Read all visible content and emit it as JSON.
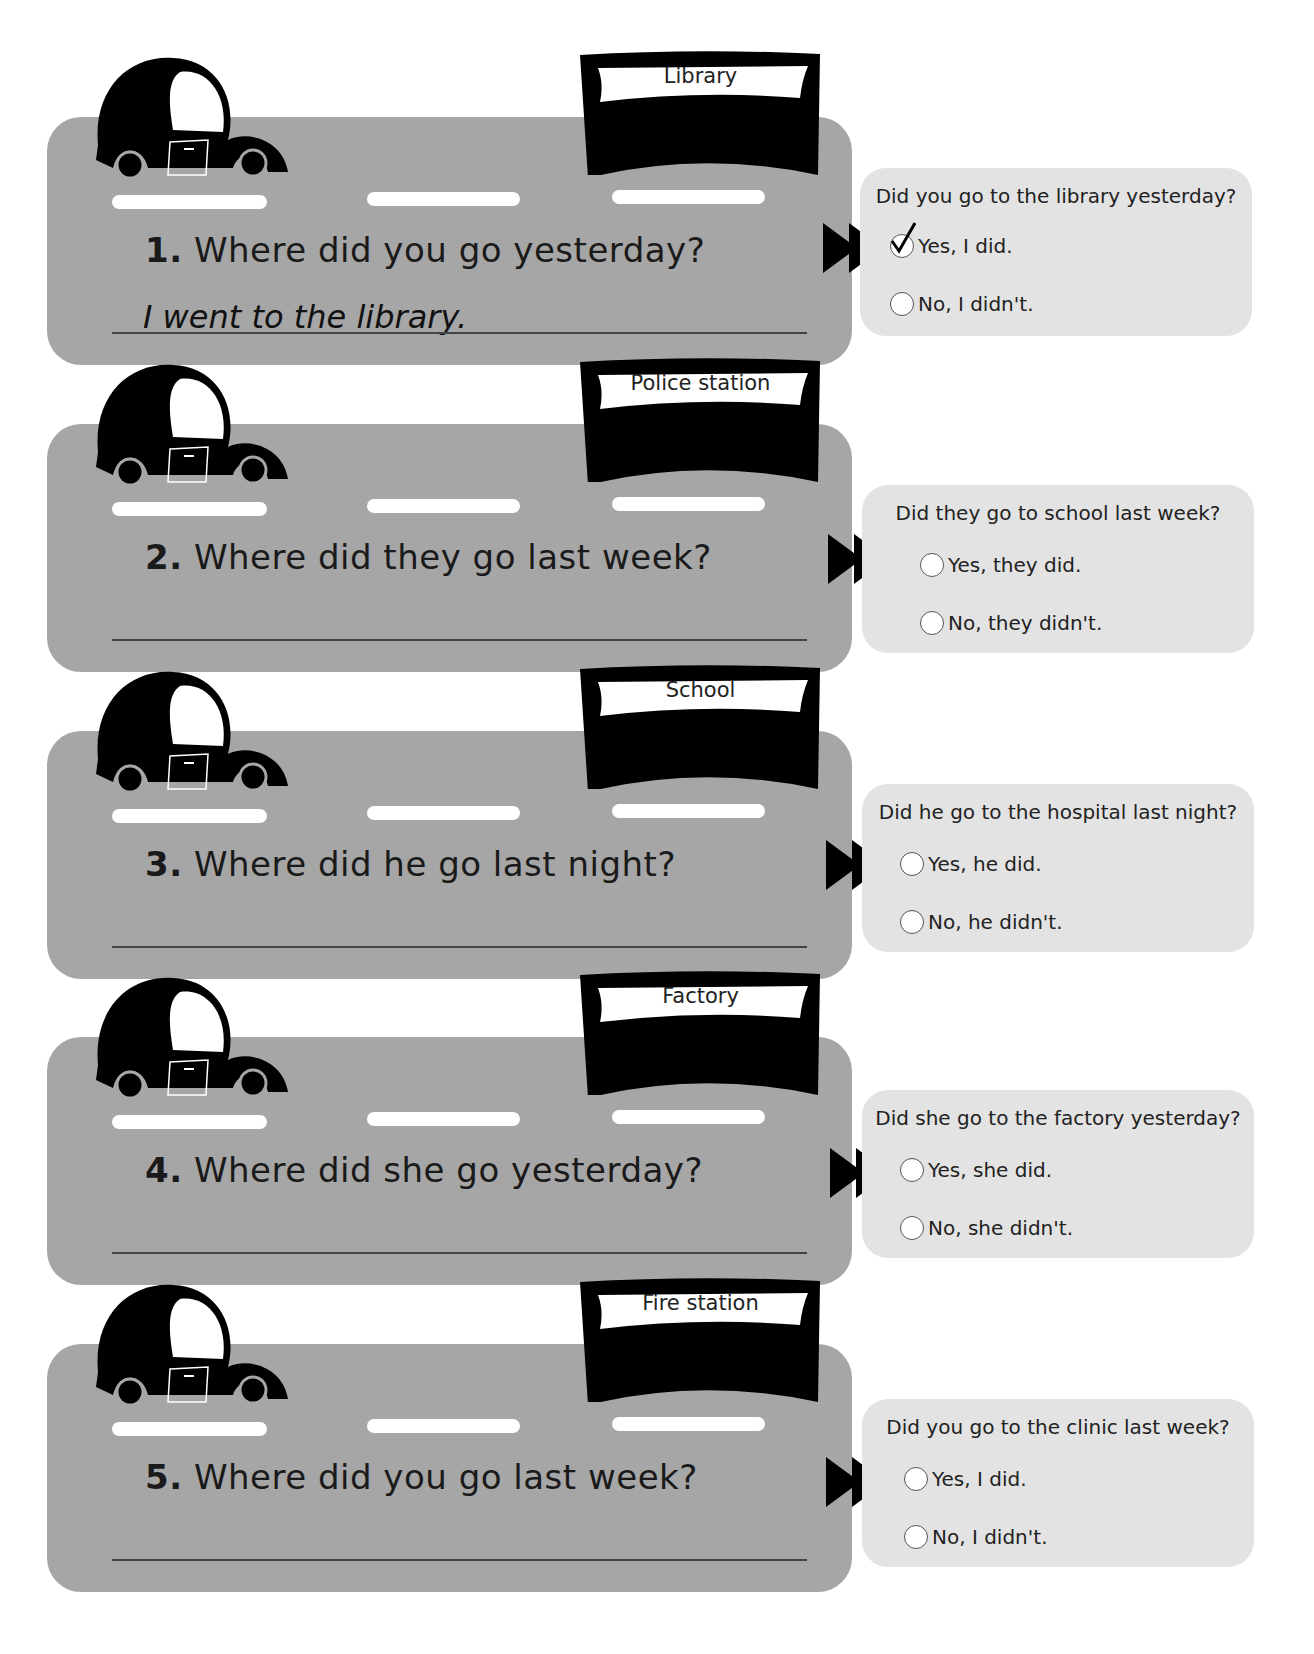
{
  "worksheet": {
    "items": [
      {
        "number": "1.",
        "question": "Where did you go yesterday?",
        "sign": "Library",
        "answer": "I went to the library.",
        "bubble": {
          "question": "Did you go to the library yesterday?",
          "yes": "Yes, I did.",
          "no": "No, I didn't.",
          "selected": "yes"
        }
      },
      {
        "number": "2.",
        "question": "Where did they go last week?",
        "sign": "Police station",
        "answer": "",
        "bubble": {
          "question": "Did they go to school last week?",
          "yes": "Yes, they did.",
          "no": "No, they didn't.",
          "selected": ""
        }
      },
      {
        "number": "3.",
        "question": "Where did he go last night?",
        "sign": "School",
        "answer": "",
        "bubble": {
          "question": "Did he go to the hospital last night?",
          "yes": "Yes, he did.",
          "no": "No, he didn't.",
          "selected": ""
        }
      },
      {
        "number": "4.",
        "question": "Where did she go yesterday?",
        "sign": "Factory",
        "answer": "",
        "bubble": {
          "question": "Did she go to the factory yesterday?",
          "yes": "Yes, she did.",
          "no": "No, she didn't.",
          "selected": ""
        }
      },
      {
        "number": "5.",
        "question": "Where did you go last week?",
        "sign": "Fire station",
        "answer": "",
        "bubble": {
          "question": "Did you go to the clinic last week?",
          "yes": "Yes, I did.",
          "no": "No, I didn't.",
          "selected": ""
        }
      }
    ]
  },
  "colors": {
    "road": "#a6a6a6",
    "bubble": "#e3e3e3",
    "ink": "#000000"
  }
}
